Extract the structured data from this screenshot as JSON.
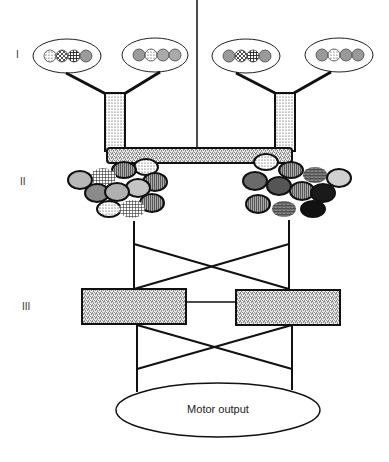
{
  "diagram": {
    "levels": [
      {
        "id": "level-1",
        "label": "I"
      },
      {
        "id": "level-2",
        "label": "II"
      },
      {
        "id": "level-3",
        "label": "III"
      }
    ],
    "output": {
      "label": "Motor output"
    },
    "colors": {
      "stroke": "#111111",
      "light_gray": "#c8c8c8",
      "mid_gray": "#9a9a9a",
      "dark_gray": "#666666",
      "black": "#151515",
      "background": "#ffffff"
    },
    "input_groups": [
      {
        "id": "input-group-1",
        "circles": 4
      },
      {
        "id": "input-group-2",
        "circles": 4
      },
      {
        "id": "input-group-3",
        "circles": 4
      },
      {
        "id": "input-group-4",
        "circles": 4
      }
    ]
  }
}
